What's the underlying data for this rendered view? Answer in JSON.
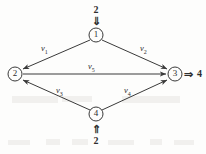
{
  "figure": {
    "type": "directed-flow-network",
    "nodes": [
      {
        "id": "1",
        "label": "1",
        "cx": 96,
        "cy": 35,
        "r": 7
      },
      {
        "id": "2",
        "label": "2",
        "cx": 15,
        "cy": 74,
        "r": 7
      },
      {
        "id": "3",
        "label": "3",
        "cx": 175,
        "cy": 74,
        "r": 7
      },
      {
        "id": "4",
        "label": "4",
        "cx": 96,
        "cy": 114,
        "r": 7
      }
    ],
    "edges": [
      {
        "id": "e1",
        "from": "1",
        "to": "2",
        "label": "v",
        "sub": "1"
      },
      {
        "id": "e2",
        "from": "1",
        "to": "3",
        "label": "v",
        "sub": "2"
      },
      {
        "id": "e3",
        "from": "4",
        "to": "2",
        "label": "v",
        "sub": "3"
      },
      {
        "id": "e4",
        "from": "4",
        "to": "3",
        "label": "v",
        "sub": "4"
      },
      {
        "id": "e5",
        "from": "2",
        "to": "3",
        "label": "v",
        "sub": "5"
      }
    ],
    "inflows": [
      {
        "id": "in-top",
        "value": "2",
        "arrow": "⇓",
        "target": "1"
      },
      {
        "id": "in-bottom",
        "value": "2",
        "arrow": "⇑",
        "target": "4"
      }
    ],
    "outflows": [
      {
        "id": "out-right",
        "value": "4",
        "arrow": "⇒",
        "source": "3"
      }
    ],
    "colors": {
      "stroke": "#3a3a3a",
      "text": "#2e2e2e",
      "background": "#fdfdfc"
    }
  }
}
